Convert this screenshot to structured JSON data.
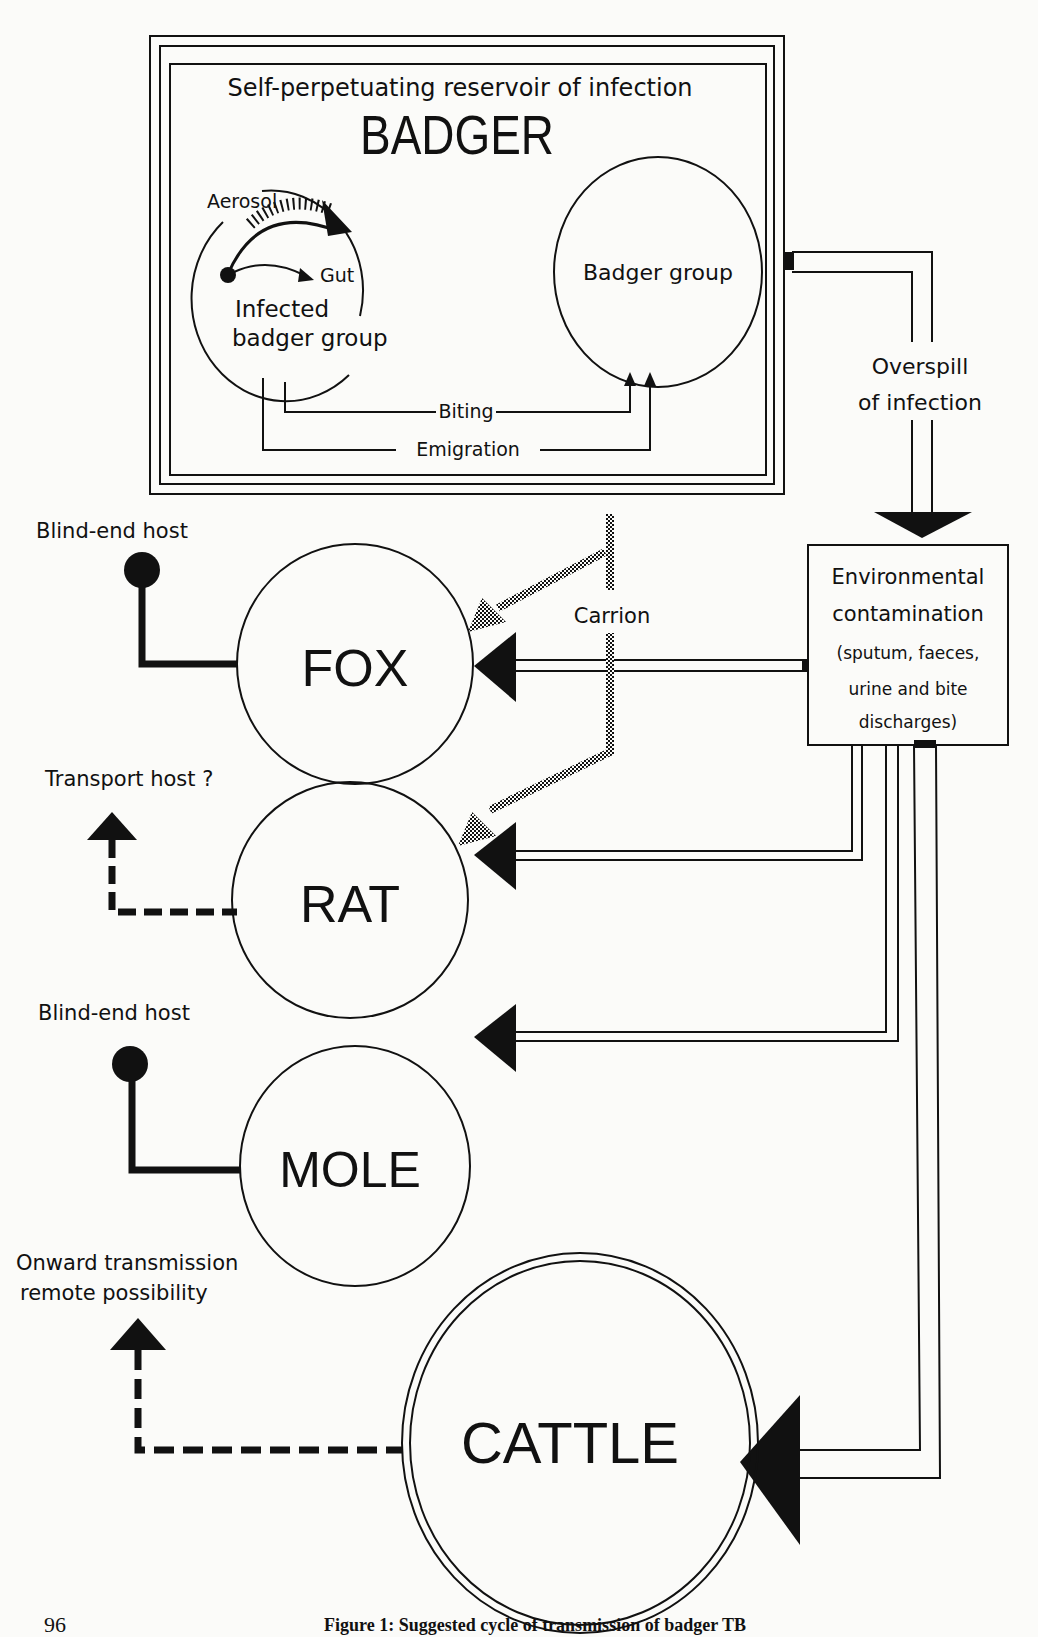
{
  "figure": {
    "caption": "Figure 1: Suggested cycle of transmission of badger TB",
    "page_number": "96"
  },
  "badger_box": {
    "subtitle": "Self-perpetuating reservoir of infection",
    "title": "BADGER",
    "infected_group": {
      "line1": "Infected",
      "line2": "badger group"
    },
    "aerosol_label": "Aerosol",
    "gut_label": "Gut",
    "badger_group_label": "Badger group",
    "biting_label": "Biting",
    "emigration_label": "Emigration"
  },
  "overspill": {
    "line1": "Overspill",
    "line2": "of infection"
  },
  "environment": {
    "line1": "Environmental",
    "line2": "contamination",
    "line3": "(sputum, faeces,",
    "line4": "urine and bite",
    "line5": "discharges)"
  },
  "carrion_label": "Carrion",
  "hosts": [
    {
      "name": "FOX",
      "role": "Blind-end host"
    },
    {
      "name": "RAT",
      "role": "Transport host ?"
    },
    {
      "name": "MOLE",
      "role": "Blind-end host"
    },
    {
      "name": "CATTLE",
      "role_line1": "Onward transmission",
      "role_line2": "remote  possibility"
    }
  ],
  "colors": {
    "ink": "#111111",
    "paper": "#fbfbf9"
  }
}
